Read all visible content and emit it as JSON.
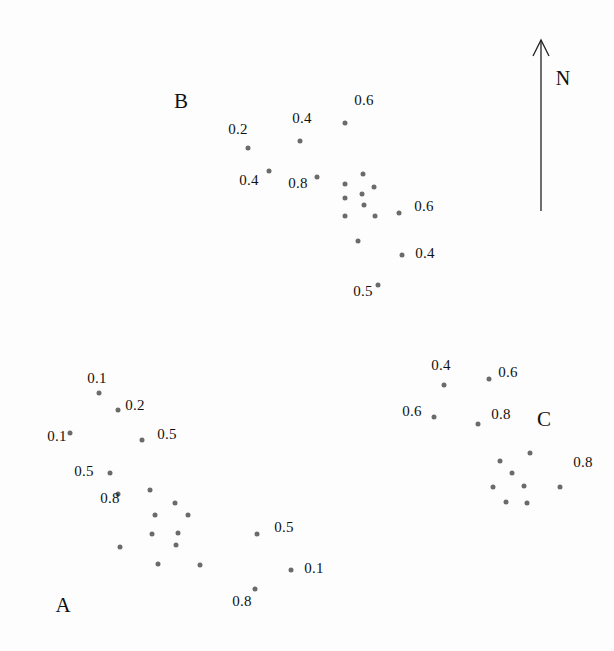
{
  "figure": {
    "background_color": "#fdfdfd",
    "point_color": "#6b6b6b",
    "text_color": "#111111",
    "width": 614,
    "height": 651
  },
  "north_arrow": {
    "label": "N",
    "label_x": 563,
    "label_y": 78,
    "shaft_x": 541,
    "shaft_top_y": 40,
    "shaft_bottom_y": 211
  },
  "cluster_labels": [
    {
      "name": "B",
      "text": "B",
      "x": 181,
      "y": 101
    },
    {
      "name": "A",
      "text": "A",
      "x": 63,
      "y": 605
    },
    {
      "name": "C",
      "text": "C",
      "x": 544,
      "y": 419
    }
  ],
  "chart_data": {
    "type": "scatter",
    "title": "",
    "xlabel": "",
    "ylabel": "",
    "grid": false,
    "legend": "none",
    "axis_visible": false,
    "xlim": [
      0,
      614
    ],
    "ylim": [
      651,
      0
    ],
    "annotations": [
      "N",
      "A",
      "B",
      "C"
    ],
    "series": [
      {
        "name": "A",
        "label": "A",
        "points": [
          {
            "x": 99,
            "y": 393,
            "value": "0.1",
            "value_x": 97,
            "value_y": 378
          },
          {
            "x": 118,
            "y": 410,
            "value": "0.2",
            "value_x": 135,
            "value_y": 405
          },
          {
            "x": 70,
            "y": 433,
            "value": "0.1",
            "value_x": 57,
            "value_y": 436
          },
          {
            "x": 142,
            "y": 440,
            "value": "0.5",
            "value_x": 167,
            "value_y": 434
          },
          {
            "x": 110,
            "y": 473,
            "value": "0.5",
            "value_x": 84,
            "value_y": 471
          },
          {
            "x": 150,
            "y": 490,
            "value": "",
            "value_x": 0,
            "value_y": 0
          },
          {
            "x": 175,
            "y": 503,
            "value": "",
            "value_x": 0,
            "value_y": 0
          },
          {
            "x": 118,
            "y": 494,
            "value": "0.8",
            "value_x": 110,
            "value_y": 498
          },
          {
            "x": 155,
            "y": 515,
            "value": "",
            "value_x": 0,
            "value_y": 0
          },
          {
            "x": 188,
            "y": 515,
            "value": "",
            "value_x": 0,
            "value_y": 0
          },
          {
            "x": 152,
            "y": 534,
            "value": "",
            "value_x": 0,
            "value_y": 0
          },
          {
            "x": 178,
            "y": 533,
            "value": "",
            "value_x": 0,
            "value_y": 0
          },
          {
            "x": 176,
            "y": 545,
            "value": "",
            "value_x": 0,
            "value_y": 0
          },
          {
            "x": 120,
            "y": 547,
            "value": "",
            "value_x": 0,
            "value_y": 0
          },
          {
            "x": 158,
            "y": 564,
            "value": "",
            "value_x": 0,
            "value_y": 0
          },
          {
            "x": 200,
            "y": 565,
            "value": "",
            "value_x": 0,
            "value_y": 0
          },
          {
            "x": 257,
            "y": 534,
            "value": "0.5",
            "value_x": 284,
            "value_y": 527
          },
          {
            "x": 291,
            "y": 570,
            "value": "0.1",
            "value_x": 314,
            "value_y": 568
          },
          {
            "x": 255,
            "y": 589,
            "value": "0.8",
            "value_x": 242,
            "value_y": 601
          }
        ]
      },
      {
        "name": "B",
        "label": "B",
        "points": [
          {
            "x": 345,
            "y": 123,
            "value": "0.6",
            "value_x": 364,
            "value_y": 100
          },
          {
            "x": 300,
            "y": 141,
            "value": "0.4",
            "value_x": 302,
            "value_y": 118
          },
          {
            "x": 248,
            "y": 148,
            "value": "0.2",
            "value_x": 238,
            "value_y": 129
          },
          {
            "x": 269,
            "y": 171,
            "value": "0.4",
            "value_x": 249,
            "value_y": 180
          },
          {
            "x": 317,
            "y": 177,
            "value": "0.8",
            "value_x": 298,
            "value_y": 183
          },
          {
            "x": 363,
            "y": 174,
            "value": "",
            "value_x": 0,
            "value_y": 0
          },
          {
            "x": 345,
            "y": 184,
            "value": "",
            "value_x": 0,
            "value_y": 0
          },
          {
            "x": 374,
            "y": 187,
            "value": "",
            "value_x": 0,
            "value_y": 0
          },
          {
            "x": 345,
            "y": 198,
            "value": "",
            "value_x": 0,
            "value_y": 0
          },
          {
            "x": 362,
            "y": 194,
            "value": "",
            "value_x": 0,
            "value_y": 0
          },
          {
            "x": 364,
            "y": 205,
            "value": "",
            "value_x": 0,
            "value_y": 0
          },
          {
            "x": 345,
            "y": 216,
            "value": "",
            "value_x": 0,
            "value_y": 0
          },
          {
            "x": 375,
            "y": 216,
            "value": "",
            "value_x": 0,
            "value_y": 0
          },
          {
            "x": 399,
            "y": 213,
            "value": "0.6",
            "value_x": 424,
            "value_y": 206
          },
          {
            "x": 358,
            "y": 241,
            "value": "",
            "value_x": 0,
            "value_y": 0
          },
          {
            "x": 402,
            "y": 255,
            "value": "0.4",
            "value_x": 425,
            "value_y": 253
          },
          {
            "x": 378,
            "y": 285,
            "value": "0.5",
            "value_x": 363,
            "value_y": 291
          }
        ]
      },
      {
        "name": "C",
        "label": "C",
        "points": [
          {
            "x": 444,
            "y": 385,
            "value": "0.4",
            "value_x": 441,
            "value_y": 365
          },
          {
            "x": 489,
            "y": 379,
            "value": "0.6",
            "value_x": 508,
            "value_y": 372
          },
          {
            "x": 434,
            "y": 417,
            "value": "0.6",
            "value_x": 412,
            "value_y": 411
          },
          {
            "x": 478,
            "y": 424,
            "value": "0.8",
            "value_x": 501,
            "value_y": 414
          },
          {
            "x": 530,
            "y": 453,
            "value": "",
            "value_x": 0,
            "value_y": 0
          },
          {
            "x": 500,
            "y": 461,
            "value": "",
            "value_x": 0,
            "value_y": 0
          },
          {
            "x": 512,
            "y": 473,
            "value": "",
            "value_x": 0,
            "value_y": 0
          },
          {
            "x": 493,
            "y": 487,
            "value": "",
            "value_x": 0,
            "value_y": 0
          },
          {
            "x": 524,
            "y": 486,
            "value": "",
            "value_x": 0,
            "value_y": 0
          },
          {
            "x": 506,
            "y": 502,
            "value": "",
            "value_x": 0,
            "value_y": 0
          },
          {
            "x": 527,
            "y": 503,
            "value": "",
            "value_x": 0,
            "value_y": 0
          },
          {
            "x": 560,
            "y": 487,
            "value": "0.8",
            "value_x": 583,
            "value_y": 462
          }
        ]
      }
    ]
  }
}
